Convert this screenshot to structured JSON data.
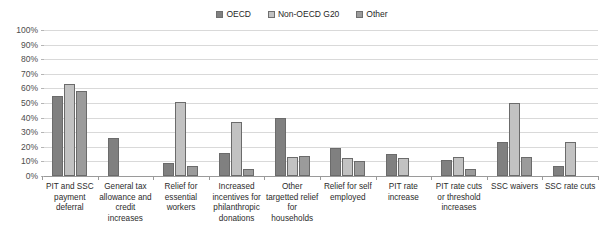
{
  "chart_data": {
    "type": "bar",
    "title": "",
    "xlabel": "",
    "ylabel": "",
    "ylim": [
      0,
      100
    ],
    "grid": true,
    "legend_position": "top-center",
    "categories": [
      "PIT and SSC payment deferral",
      "General tax allowance and credit increases",
      "Relief for essential workers",
      "Increased incentives for philanthropic donations",
      "Other targetted relief for households",
      "Relief for self employed",
      "PIT rate increase",
      "PIT rate cuts or threshold increases",
      "SSC waivers",
      "SSC rate cuts"
    ],
    "series": [
      {
        "name": "OECD",
        "color": "#808080",
        "values": [
          55,
          26,
          9,
          16,
          40,
          19,
          15,
          11,
          23,
          7
        ]
      },
      {
        "name": "Non-OECD G20",
        "color": "#c2c2c2",
        "values": [
          63,
          0,
          51,
          37,
          13,
          12,
          12,
          13,
          50,
          23
        ]
      },
      {
        "name": "Other",
        "color": "#9b9b9b",
        "values": [
          58,
          0,
          7,
          5,
          14,
          10,
          0,
          5,
          13,
          0
        ]
      }
    ],
    "ytick_labels": [
      "100%",
      "90%",
      "80%",
      "70%",
      "60%",
      "50%",
      "40%",
      "30%",
      "20%",
      "10%",
      "0%"
    ],
    "ytick_values": [
      100,
      90,
      80,
      70,
      60,
      50,
      40,
      30,
      20,
      10,
      0
    ]
  }
}
